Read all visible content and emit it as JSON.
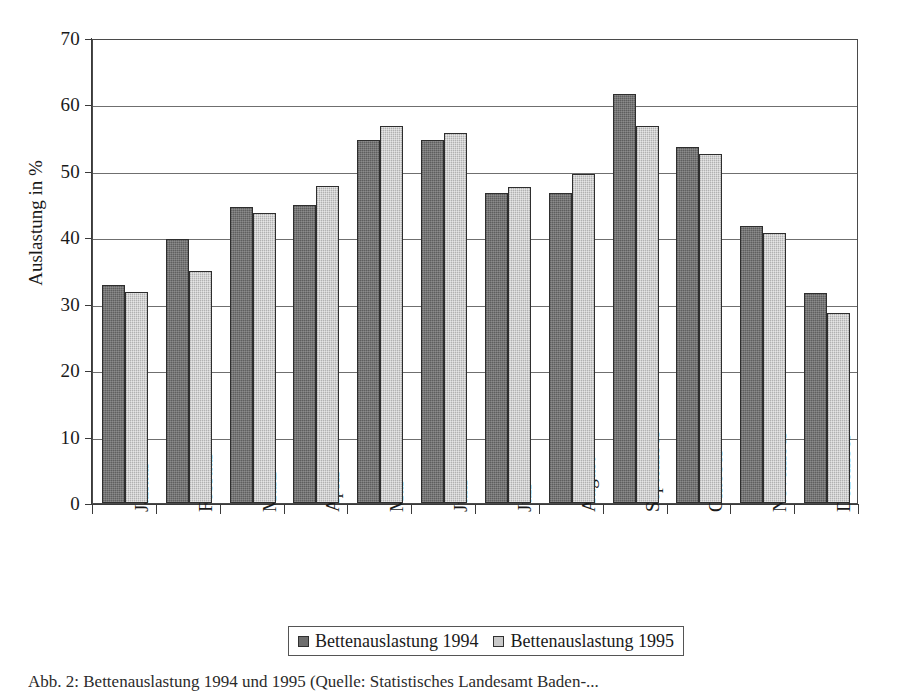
{
  "chart_data": {
    "type": "bar",
    "title": "",
    "xlabel": "",
    "ylabel": "Auslastung in %",
    "ylim": [
      0,
      70
    ],
    "yticks": [
      0,
      10,
      20,
      30,
      40,
      50,
      60,
      70
    ],
    "grid": true,
    "legend_position": "bottom",
    "categories": [
      "Januar",
      "Februar",
      "März",
      "April",
      "Mai",
      "Juni",
      "Juli",
      "August",
      "September",
      "Oktober",
      "November",
      "Dezember"
    ],
    "series": [
      {
        "name": "Bettenauslastung 1994",
        "color": "#6e6e6e",
        "values": [
          32.8,
          39.8,
          44.6,
          44.8,
          54.7,
          54.7,
          46.6,
          46.6,
          61.6,
          53.6,
          41.7,
          31.6
        ]
      },
      {
        "name": "Bettenauslastung 1995",
        "color": "#c9c9c9",
        "values": [
          31.8,
          34.9,
          43.7,
          47.7,
          56.8,
          55.7,
          47.6,
          49.6,
          56.7,
          52.6,
          40.7,
          28.6
        ]
      }
    ]
  },
  "axes": {
    "y_title": "Auslastung in %",
    "y_tick_labels": [
      "0",
      "10",
      "20",
      "30",
      "40",
      "50",
      "60",
      "70"
    ]
  },
  "legend": {
    "entries": [
      {
        "label": "Bettenauslastung 1994",
        "swatch": "dark-gray-swatch"
      },
      {
        "label": "Bettenauslastung 1995",
        "swatch": "light-gray-swatch"
      }
    ]
  },
  "caption": {
    "text": "Abb. 2: Bettenauslastung 1994 und 1995 (Quelle: Statistisches Landesamt Baden-..."
  }
}
